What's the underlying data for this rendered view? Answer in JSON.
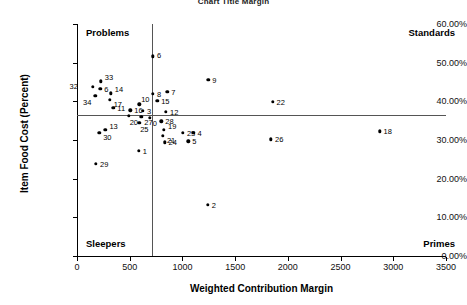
{
  "chart_data": {
    "type": "scatter",
    "title": "Chart Title Margin",
    "xlabel": "Weighted Contribution Margin",
    "ylabel": "Item Food Cost (Percent)",
    "xlim": [
      0,
      3500
    ],
    "ylim": [
      0,
      0.6
    ],
    "xticks": [
      0,
      500,
      1000,
      1500,
      2000,
      2500,
      3000,
      3500
    ],
    "xtick_labels": [
      "0",
      "500",
      "1000",
      "1500",
      "2000",
      "2500",
      "3000",
      "3500"
    ],
    "yticks": [
      0,
      0.1,
      0.2,
      0.3,
      0.4,
      0.5,
      0.6
    ],
    "ytick_labels": [
      "0.00%",
      "10.00%",
      "20.00%",
      "30.00%",
      "40.00%",
      "50.00%",
      "60.00%"
    ],
    "grid": false,
    "legend": "none",
    "reference_lines": {
      "vertical_x": 715,
      "horizontal_y": 0.364
    },
    "quadrant_labels": {
      "top_left": "Problems",
      "top_right": "Standards",
      "bottom_left": "Sleepers",
      "bottom_right": "Primes"
    },
    "point_label_field": "label",
    "points": [
      {
        "label": "32",
        "x": 150,
        "y": 0.437,
        "lx": -15,
        "ly": -1
      },
      {
        "label": "33",
        "x": 225,
        "y": 0.452,
        "lx": 4,
        "ly": -4
      },
      {
        "label": "6",
        "x": 220,
        "y": 0.432,
        "lx": 4,
        "ly": 0
      },
      {
        "label": "34",
        "x": 175,
        "y": 0.415,
        "lx": -4,
        "ly": 6
      },
      {
        "label": "14",
        "x": 320,
        "y": 0.421,
        "lx": 4,
        "ly": -4
      },
      {
        "label": "17",
        "x": 310,
        "y": 0.404,
        "lx": 4,
        "ly": 4
      },
      {
        "label": "11",
        "x": 345,
        "y": 0.383,
        "lx": 4,
        "ly": 0
      },
      {
        "label": "13",
        "x": 270,
        "y": 0.327,
        "lx": 4,
        "ly": -4
      },
      {
        "label": "30",
        "x": 210,
        "y": 0.318,
        "lx": 4,
        "ly": 4
      },
      {
        "label": "29",
        "x": 180,
        "y": 0.238,
        "lx": 4,
        "ly": 0
      },
      {
        "label": "16",
        "x": 505,
        "y": 0.377,
        "lx": 4,
        "ly": 0
      },
      {
        "label": "20",
        "x": 490,
        "y": 0.363,
        "lx": 1,
        "ly": 6
      },
      {
        "label": "10",
        "x": 590,
        "y": 0.392,
        "lx": 2,
        "ly": -5
      },
      {
        "label": "3",
        "x": 625,
        "y": 0.376,
        "lx": 4,
        "ly": 0
      },
      {
        "label": "27",
        "x": 610,
        "y": 0.36,
        "lx": 3,
        "ly": 5
      },
      {
        "label": "25",
        "x": 590,
        "y": 0.345,
        "lx": 1,
        "ly": 6
      },
      {
        "label": "0",
        "x": 690,
        "y": 0.358,
        "lx": 3,
        "ly": 5
      },
      {
        "label": "1",
        "x": 585,
        "y": 0.272,
        "lx": 4,
        "ly": 0
      },
      {
        "label": "6",
        "x": 720,
        "y": 0.516,
        "lx": 4,
        "ly": -1
      },
      {
        "label": "8",
        "x": 720,
        "y": 0.42,
        "lx": 4,
        "ly": 0
      },
      {
        "label": "15",
        "x": 760,
        "y": 0.401,
        "lx": 4,
        "ly": 0
      },
      {
        "label": "7",
        "x": 855,
        "y": 0.425,
        "lx": 4,
        "ly": 0
      },
      {
        "label": "12",
        "x": 845,
        "y": 0.373,
        "lx": 4,
        "ly": 0
      },
      {
        "label": "28",
        "x": 800,
        "y": 0.348,
        "lx": 4,
        "ly": 0
      },
      {
        "label": "19",
        "x": 825,
        "y": 0.326,
        "lx": 4,
        "ly": -4
      },
      {
        "label": "21",
        "x": 815,
        "y": 0.311,
        "lx": 4,
        "ly": 4
      },
      {
        "label": "24",
        "x": 830,
        "y": 0.294,
        "lx": 4,
        "ly": 0
      },
      {
        "label": "23",
        "x": 1005,
        "y": 0.318,
        "lx": 4,
        "ly": 0
      },
      {
        "label": "4",
        "x": 1105,
        "y": 0.318,
        "lx": 4,
        "ly": 0
      },
      {
        "label": "5",
        "x": 1055,
        "y": 0.297,
        "lx": 4,
        "ly": 0
      },
      {
        "label": "9",
        "x": 1245,
        "y": 0.455,
        "lx": 4,
        "ly": 0
      },
      {
        "label": "2",
        "x": 1240,
        "y": 0.132,
        "lx": 4,
        "ly": 0
      },
      {
        "label": "22",
        "x": 1855,
        "y": 0.398,
        "lx": 4,
        "ly": 0
      },
      {
        "label": "26",
        "x": 1840,
        "y": 0.302,
        "lx": 4,
        "ly": 0
      },
      {
        "label": "18",
        "x": 2870,
        "y": 0.322,
        "lx": 4,
        "ly": 0
      }
    ]
  }
}
